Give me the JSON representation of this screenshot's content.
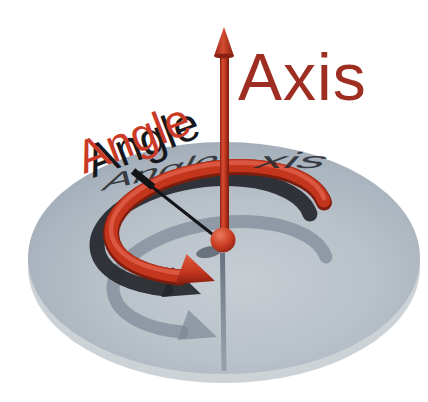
{
  "figure": {
    "caption": "Axis-angle rotation illustration",
    "labels": {
      "axis": "Axis",
      "angle": "Angle"
    },
    "cast_shadows": {
      "angle_text": "Angle",
      "axis_text_fragment": "xis"
    },
    "colors": {
      "background": "#ffffff",
      "disc_center": "#c4cbd1",
      "disc_edge": "#a3adb8",
      "disc_rim": "#cdd2d7",
      "arrow_red": "#c4351e",
      "arrow_red_highlight": "#e0614a",
      "arrow_red_dark": "#7c1d0e",
      "axis_label": "#9d2e21",
      "angle_label": "#ca3a27",
      "label_shadow": "#17181c",
      "cast_shadow": "#24272d",
      "reflection_gray": "#7e8795",
      "axis_shadow_line": "#141519"
    }
  }
}
